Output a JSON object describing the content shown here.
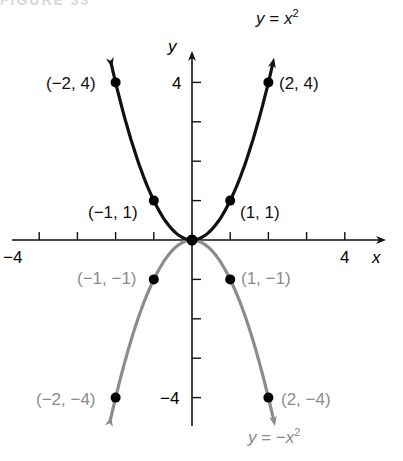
{
  "figure": {
    "title": "FIGURE 33"
  },
  "colors": {
    "axis": "#111111",
    "black_curve": "#111111",
    "gray_curve": "#8c8c8c",
    "gray_text": "#8c8c8c",
    "point": "#000000"
  },
  "axes": {
    "x_label": "x",
    "y_label": "y",
    "x_tick_labels": [
      {
        "value": -4,
        "text": "−4"
      },
      {
        "value": 4,
        "text": "4"
      }
    ],
    "y_tick_labels": [
      {
        "value": 4,
        "text": "4"
      },
      {
        "value": -4,
        "text": "−4"
      }
    ]
  },
  "equations": {
    "upper": {
      "prefix": "y = x",
      "sup": "2"
    },
    "lower": {
      "prefix": "y = −x",
      "sup": "2"
    }
  },
  "points": {
    "upper": [
      {
        "x": -2,
        "y": 4,
        "label": "(−2, 4)"
      },
      {
        "x": -1,
        "y": 1,
        "label": "(−1, 1)"
      },
      {
        "x": 0,
        "y": 0,
        "label": ""
      },
      {
        "x": 1,
        "y": 1,
        "label": "(1, 1)"
      },
      {
        "x": 2,
        "y": 4,
        "label": "(2, 4)"
      }
    ],
    "lower": [
      {
        "x": -2,
        "y": -4,
        "label": "(−2, −4)"
      },
      {
        "x": -1,
        "y": -1,
        "label": "(−1, −1)"
      },
      {
        "x": 1,
        "y": -1,
        "label": "(1, −1)"
      },
      {
        "x": 2,
        "y": -4,
        "label": "(2, −4)"
      }
    ]
  },
  "chart_data": {
    "type": "line",
    "title": "",
    "xlabel": "x",
    "ylabel": "y",
    "xlim": [
      -4.6,
      5
    ],
    "ylim": [
      -4.7,
      4.6
    ],
    "grid": false,
    "x_ticks": [
      -4,
      -3,
      -2,
      -1,
      1,
      2,
      3,
      4
    ],
    "y_ticks": [
      -4,
      -3,
      -2,
      -1,
      1,
      2,
      3,
      4
    ],
    "series": [
      {
        "name": "y = x^2",
        "color": "#111111",
        "x": [
          -2,
          -1,
          0,
          1,
          2
        ],
        "y": [
          4,
          1,
          0,
          1,
          4
        ]
      },
      {
        "name": "y = -x^2",
        "color": "#8c8c8c",
        "x": [
          -2,
          -1,
          0,
          1,
          2
        ],
        "y": [
          -4,
          -1,
          0,
          -1,
          -4
        ]
      }
    ],
    "annotations": [
      "(−2, 4)",
      "(−1, 1)",
      "(1, 1)",
      "(2, 4)",
      "(−2, −4)",
      "(−1, −1)",
      "(1, −1)",
      "(2, −4)",
      "y = x²",
      "y = −x²"
    ]
  }
}
